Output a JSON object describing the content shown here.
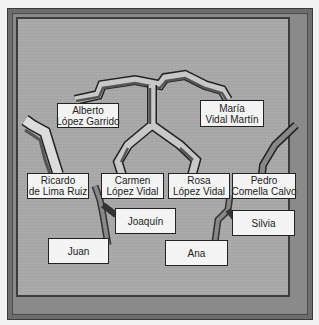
{
  "diagram": {
    "type": "family-tree",
    "people": {
      "alberto": {
        "line1": "Alberto",
        "line2": "López Garrido"
      },
      "maria": {
        "line1": "María",
        "line2": "Vidal Martín"
      },
      "ricardo": {
        "line1": "Ricardo",
        "line2": "de Lima Ruiz"
      },
      "carmen": {
        "line1": "Carmen",
        "line2": "López Vidal"
      },
      "rosa": {
        "line1": "Rosa",
        "line2": "López Vidal"
      },
      "pedro": {
        "line1": "Pedro",
        "line2": "Comella Calvo"
      },
      "joaquin": {
        "line1": "Joaquín"
      },
      "silvia": {
        "line1": "Silvia"
      },
      "juan": {
        "line1": "Juan"
      },
      "ana": {
        "line1": "Ana"
      }
    },
    "relations": [
      {
        "parents": [
          "Alberto López Garrido",
          "María Vidal Martín"
        ],
        "children": [
          "Carmen López Vidal",
          "Rosa López Vidal"
        ]
      },
      {
        "parents": [
          "Ricardo de Lima Ruiz",
          "Carmen López Vidal"
        ],
        "children": [
          "Joaquín",
          "Juan"
        ]
      },
      {
        "parents": [
          "Rosa López Vidal",
          "Pedro Comella Calvo"
        ],
        "children": [
          "Ana",
          "Silvia"
        ]
      }
    ],
    "colors": {
      "panel": "#a9a9a9",
      "frame": "#6e6e6e",
      "branch_light": "#c8c8c8",
      "branch_dark": "#555555",
      "box": "#f4f4f4"
    }
  }
}
